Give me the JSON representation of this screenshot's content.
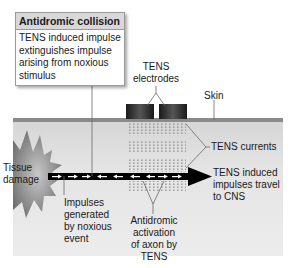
{
  "callout": {
    "title": "Antidromic collision",
    "body_lines": [
      "TENS induced impulse",
      "extinguishes impulse",
      "arising from noxious",
      "stimulus"
    ]
  },
  "labels": {
    "electrodes": [
      "TENS",
      "electrodes"
    ],
    "skin": "Skin",
    "tens_currents": "TENS currents",
    "tissue_damage": [
      "Tissue",
      "damage"
    ],
    "tens_impulses": [
      "TENS induced",
      "impulses travel",
      "to CNS"
    ],
    "noxious_impulses": [
      "Impulses",
      "generated",
      "by noxious",
      "event"
    ],
    "antidromic": [
      "Antidromic",
      "activation",
      "of axon by",
      "TENS"
    ]
  },
  "colors": {
    "skin": "#8a8a8a",
    "tissue": "#e4e4e4",
    "electrode": "#2a2a2a",
    "axon": "#000000",
    "starburst": "#9a9a9a"
  }
}
